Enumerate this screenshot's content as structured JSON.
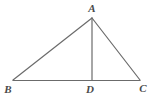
{
  "figure": {
    "kind": "geometry-diagram",
    "background_color": "#ffffff",
    "line_color": "#6b6b6b",
    "label_color": "#4a4a4a",
    "canvas": {
      "width": 156,
      "height": 106
    },
    "points": {
      "A": {
        "label": "A",
        "x": 92,
        "y": 18
      },
      "B": {
        "label": "B",
        "x": 13,
        "y": 80
      },
      "C": {
        "label": "C",
        "x": 140,
        "y": 80
      },
      "D": {
        "label": "D",
        "x": 92,
        "y": 80
      }
    },
    "label_positions": {
      "A": {
        "x": 92,
        "y": 12
      },
      "B": {
        "x": 8,
        "y": 93
      },
      "D": {
        "x": 90,
        "y": 93
      },
      "C": {
        "x": 143,
        "y": 92
      }
    },
    "segments": [
      {
        "name": "AB",
        "from": "A",
        "to": "B"
      },
      {
        "name": "AC",
        "from": "A",
        "to": "C"
      },
      {
        "name": "BC",
        "from": "B",
        "to": "C"
      },
      {
        "name": "AD",
        "from": "A",
        "to": "D"
      }
    ]
  }
}
